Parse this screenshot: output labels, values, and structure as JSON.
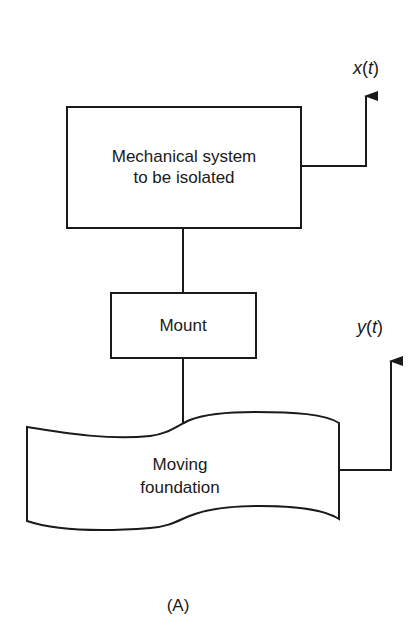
{
  "diagram": {
    "figure_label": "(A)",
    "colors": {
      "line": "#1a1a1a",
      "background": "#ffffff"
    },
    "nodes": {
      "system": {
        "line1": "Mechanical system",
        "line2": "to be isolated"
      },
      "mount": {
        "label": "Mount"
      },
      "foundation": {
        "line1": "Moving",
        "line2": "foundation"
      }
    },
    "signals": {
      "output": {
        "var": "x",
        "open": "(",
        "arg": "t",
        "close": ")"
      },
      "input": {
        "var": "y",
        "open": "(",
        "arg": "t",
        "close": ")"
      }
    },
    "connections": [
      {
        "from": "system",
        "to": "mount"
      },
      {
        "from": "mount",
        "to": "foundation"
      },
      {
        "from": "system",
        "to": "output-arrow"
      },
      {
        "from": "foundation",
        "to": "input-arrow"
      }
    ]
  }
}
